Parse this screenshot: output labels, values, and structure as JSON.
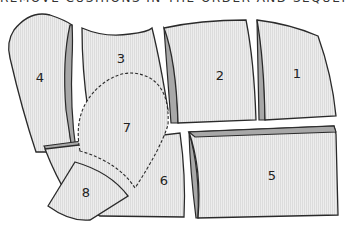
{
  "title": "REMOVE CUSHIONS IN THE ORDER AND SEQUENCE OF USE",
  "colors": {
    "fill": "#ececec",
    "hatch": "#dcdcdc",
    "side": "#a8a8a8",
    "outline": "#2a2a2a"
  },
  "pieces": [
    {
      "id": "1",
      "label": "1"
    },
    {
      "id": "2",
      "label": "2"
    },
    {
      "id": "3",
      "label": "3"
    },
    {
      "id": "4",
      "label": "4"
    },
    {
      "id": "5",
      "label": "5"
    },
    {
      "id": "6",
      "label": "6"
    },
    {
      "id": "7",
      "label": "7"
    },
    {
      "id": "8",
      "label": "8"
    }
  ]
}
